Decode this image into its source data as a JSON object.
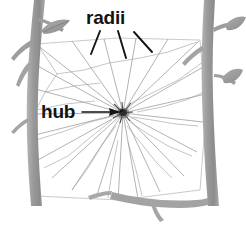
{
  "figure": {
    "background_color": "#ffffff",
    "width": 246,
    "height": 225
  },
  "labels": [
    {
      "id": "radii",
      "text": "radii",
      "color": "#131313",
      "position": {
        "x": 86,
        "y": 8
      },
      "leader_lines": 3
    },
    {
      "id": "hub",
      "text": "hub",
      "color": "#131313",
      "position": {
        "x": 41,
        "y": 102
      },
      "leader_lines": 1
    }
  ],
  "web": {
    "hub_center": {
      "x": 123,
      "y": 113
    },
    "hub_color": "#3a3a3a",
    "thread_color": "#a9a9a9",
    "frame_color": "#bcbcbc",
    "radii_count": 22
  },
  "branches": {
    "bark_color": "#a2a2a2",
    "bark_shadow": "#8d8d8d",
    "leaf_color": "#9b9b9b",
    "left_leaf_count": 1,
    "right_leaf_count": 2
  },
  "annotations": {
    "radii_description": "straight threads running outward from the hub",
    "hub_description": "dense central knot where all radii meet"
  }
}
